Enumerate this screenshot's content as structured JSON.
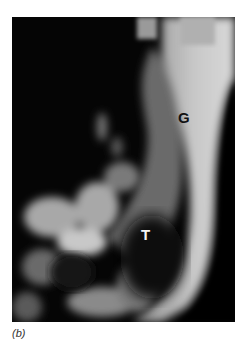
{
  "figure": {
    "panel_caption": "(b)",
    "labels": {
      "g": "G",
      "t": "T"
    },
    "image_description": "Grayscale medical scan showing a bright curved band on the right (G) and a dark rounded region (T) surrounded by mottled bright tissue in the lower left"
  }
}
